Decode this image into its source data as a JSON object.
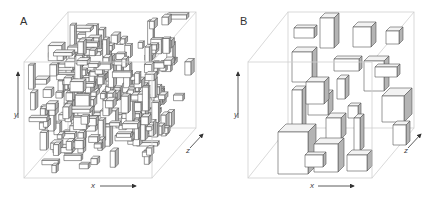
{
  "figure": {
    "panels": [
      {
        "id": "A",
        "label": "A",
        "description": "Dense random packing of many small rectangular boxes inside a transparent cube",
        "density": "high",
        "axes": {
          "x": "x",
          "y": "y",
          "z": "z"
        }
      },
      {
        "id": "B",
        "label": "B",
        "description": "Sparse arrangement of fewer, larger rectangular boxes inside a transparent cube",
        "density": "low",
        "axes": {
          "x": "x",
          "y": "y",
          "z": "z"
        }
      }
    ],
    "colors": {
      "cube_edge": "#c8c8c8",
      "box_stroke": "#555555",
      "box_front": "#ffffff",
      "box_top": "#f2f2f2",
      "box_side": "#b4b4b4",
      "arrow": "#333333"
    }
  }
}
